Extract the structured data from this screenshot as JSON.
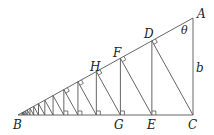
{
  "diagram": {
    "type": "geometric-construction",
    "points": {
      "A": {
        "label": "A",
        "x": 193,
        "y": 18
      },
      "B": {
        "label": "B",
        "x": 18,
        "y": 115
      },
      "C": {
        "label": "C",
        "x": 193,
        "y": 115
      },
      "D": {
        "label": "D"
      },
      "E": {
        "label": "E"
      },
      "F": {
        "label": "F"
      },
      "G": {
        "label": "G"
      },
      "H": {
        "label": "H"
      }
    },
    "angle_label": "θ",
    "side_label": "b",
    "zigzag_steps": 14,
    "line_color": "#555555",
    "text_color": "#222222"
  }
}
